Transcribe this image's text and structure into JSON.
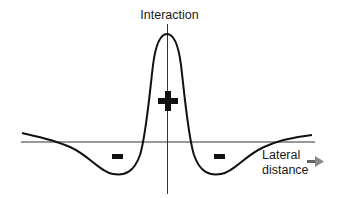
{
  "diagram": {
    "type": "interaction-profile",
    "y_axis_label": "Interaction",
    "x_axis_label_line1": "Lateral",
    "x_axis_label_line2": "distance",
    "center_sign": "+",
    "left_sign": "−",
    "right_sign": "−",
    "colors": {
      "curve": "#111111",
      "axis": "#333333",
      "arrow": "#555555",
      "background": "#ffffff"
    }
  }
}
